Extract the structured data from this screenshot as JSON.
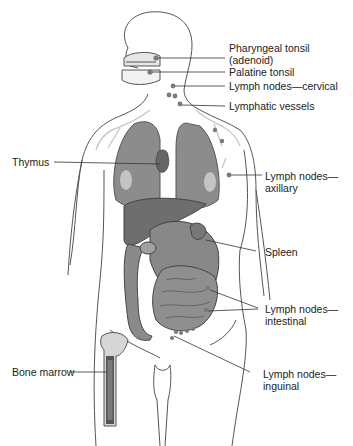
{
  "diagram": {
    "labels": {
      "pharyngeal_tonsil": [
        "Pharyngeal tonsil",
        "(adenoid)"
      ],
      "palatine_tonsil": [
        "Palatine tonsil"
      ],
      "lymph_nodes_cervical": [
        "Lymph nodes—cervical"
      ],
      "lymphatic_vessels": [
        "Lymphatic vessels"
      ],
      "thymus": [
        "Thymus"
      ],
      "lymph_nodes_axillary": [
        "Lymph nodes—",
        "axillary"
      ],
      "spleen": [
        "Spleen"
      ],
      "lymph_nodes_intestinal": [
        "Lymph nodes—",
        "intestinal"
      ],
      "bone_marrow": [
        "Bone marrow"
      ],
      "lymph_nodes_inguinal": [
        "Lymph nodes—",
        "inguinal"
      ]
    },
    "colors": {
      "outline": "#555555",
      "organ_dark": "#6e6e6e",
      "organ_mid": "#8c8c8c",
      "organ_light": "#b5b5b5",
      "vessel": "#c8c8c8",
      "node": "#7a7a7a",
      "leader": "#333333"
    }
  }
}
